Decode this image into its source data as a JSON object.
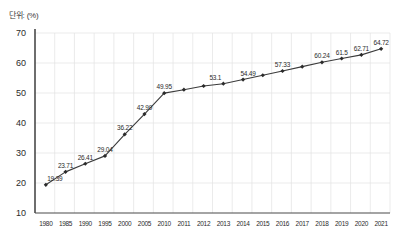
{
  "chart_data": {
    "type": "line",
    "title": "",
    "subtitle": "",
    "unit_label": "단위: (%)",
    "xlabel": "",
    "ylabel": "",
    "ylim": [
      10,
      70
    ],
    "yticks": [
      10,
      20,
      30,
      40,
      50,
      60,
      70
    ],
    "grid": true,
    "grid_axis": "both",
    "legend": false,
    "legend_position": "none",
    "line_color": "#3b3b3b",
    "marker": "diamond",
    "marker_color": "#2b2b2b",
    "categories": [
      "1980",
      "1985",
      "1990",
      "1995",
      "2000",
      "2005",
      "2010",
      "2011",
      "2012",
      "2013",
      "2014",
      "2015",
      "2016",
      "2017",
      "2018",
      "2019",
      "2020",
      "2021"
    ],
    "values": [
      19.39,
      23.71,
      26.41,
      29.04,
      36.22,
      42.99,
      49.95,
      51.1,
      52.33,
      53.1,
      54.49,
      55.91,
      57.33,
      58.79,
      60.24,
      61.5,
      62.71,
      64.72
    ],
    "point_labels": [
      "19.39",
      "23.71",
      "26.41",
      "29.04",
      "36.22",
      "42.99",
      "49.95",
      "",
      "",
      "53.1",
      "54.49",
      "",
      "57.33",
      "",
      "60.24",
      "61.5",
      "62.71",
      "64.72"
    ]
  },
  "axis": {
    "y_tick_labels": [
      "70",
      "60",
      "50",
      "40",
      "30",
      "20",
      "10"
    ],
    "x_tick_labels": [
      "1980",
      "1985",
      "1990",
      "1995",
      "2000",
      "2005",
      "2010",
      "2011",
      "2012",
      "2013",
      "2014",
      "2015",
      "2016",
      "2017",
      "2018",
      "2019",
      "2020",
      "2021"
    ]
  }
}
